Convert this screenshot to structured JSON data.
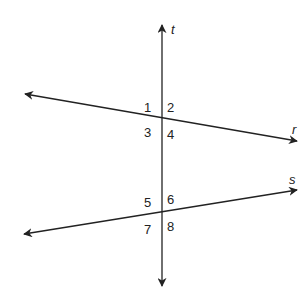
{
  "diagram": {
    "lines": {
      "t": {
        "label": "t",
        "kind": "transversal"
      },
      "r": {
        "label": "r"
      },
      "s": {
        "label": "s"
      }
    },
    "angles": [
      "1",
      "2",
      "3",
      "4",
      "5",
      "6",
      "7",
      "8"
    ],
    "colors": {
      "stroke": "#222222",
      "background": "#ffffff"
    }
  }
}
